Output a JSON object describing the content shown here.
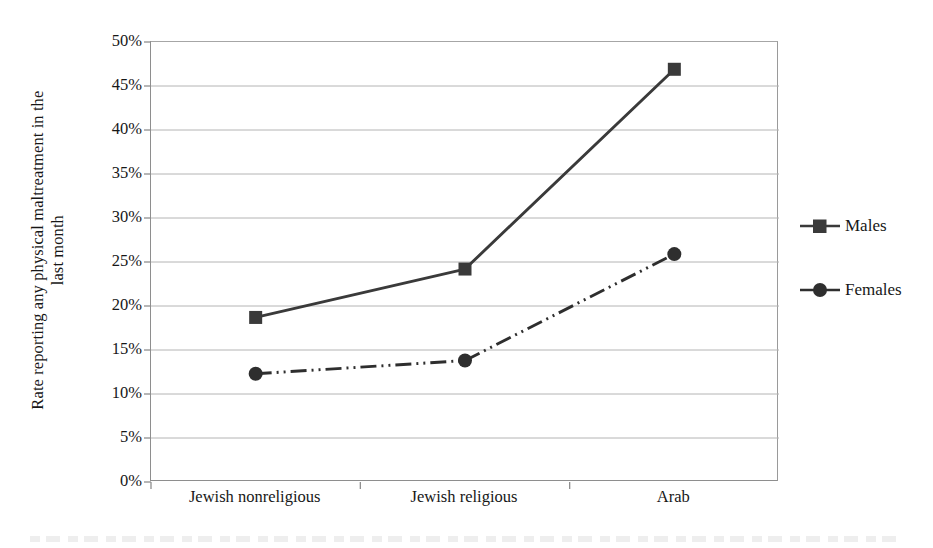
{
  "chart_data": {
    "type": "line",
    "title": "",
    "xlabel": "",
    "ylabel": "Rate reporting any physical maltreatment in the last month",
    "ylabel_line1": "Rate reporting any physical maltreatment in the",
    "ylabel_line2": "last month",
    "categories": [
      "Jewish nonreligious",
      "Jewish religious",
      "Arab"
    ],
    "ylim": [
      0,
      50
    ],
    "ytick_values": [
      0,
      5,
      10,
      15,
      20,
      25,
      30,
      35,
      40,
      45,
      50
    ],
    "ytick_labels": [
      "0%",
      "5%",
      "10%",
      "15%",
      "20%",
      "25%",
      "30%",
      "35%",
      "40%",
      "45%",
      "50%"
    ],
    "grid": true,
    "grid_axis": "y",
    "legend_position": "right",
    "series": [
      {
        "name": "Males",
        "values": [
          18.7,
          24.2,
          46.9
        ],
        "marker": "square",
        "line_style": "solid",
        "color": "#3a3a3a"
      },
      {
        "name": "Females",
        "values": [
          12.3,
          13.8,
          25.9
        ],
        "marker": "circle",
        "line_style": "dash-dot",
        "color": "#2e2e2e"
      }
    ]
  },
  "legend": {
    "items": [
      {
        "label": "Males",
        "marker": "square-marker-icon"
      },
      {
        "label": "Females",
        "marker": "circle-marker-icon"
      }
    ]
  },
  "colors": {
    "series_males": "#3a3a3a",
    "series_females": "#2e2e2e",
    "gridline": "#b4b4b4",
    "axis": "#8e8e8e",
    "text": "#171717",
    "background": "#ffffff"
  }
}
